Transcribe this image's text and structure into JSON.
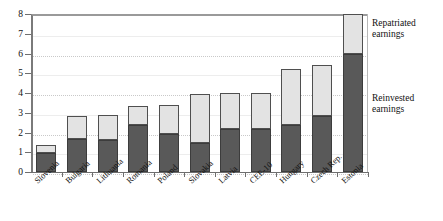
{
  "chart_data": {
    "type": "bar",
    "stacked": true,
    "title": "",
    "xlabel": "",
    "ylabel": "",
    "ylim": [
      0,
      8
    ],
    "yticks": [
      0,
      1,
      2,
      3,
      4,
      5,
      6,
      7,
      8
    ],
    "grid": true,
    "legend_position": "right-inside-annotations",
    "categories": [
      "Slovenia",
      "Bulgaria",
      "Lithuania",
      "Romania",
      "Poland",
      "Slovakia",
      "Latvia",
      "CEE-10",
      "Hungary",
      "Czech Rep.",
      "Estonia"
    ],
    "series": [
      {
        "name": "Reinvested earnings",
        "color": "#595959",
        "values": [
          0.95,
          1.65,
          1.6,
          2.4,
          1.95,
          1.45,
          2.2,
          2.2,
          2.4,
          2.85,
          6.0
        ]
      },
      {
        "name": "Repatriated earnings",
        "color": "#e3e3e3",
        "values": [
          0.4,
          1.2,
          1.3,
          0.95,
          1.45,
          2.5,
          1.8,
          1.8,
          2.8,
          2.55,
          2.0
        ]
      }
    ],
    "totals": [
      1.35,
      2.85,
      2.9,
      3.35,
      3.4,
      3.95,
      4.0,
      4.0,
      5.2,
      5.4,
      8.0
    ]
  },
  "annotations": {
    "repatriated": "Repatriated\nearnings",
    "repatriated_line1": "Repatriated",
    "repatriated_line2": "earnings",
    "reinvested_line1": "Reinvested",
    "reinvested_line2": "earnings"
  }
}
